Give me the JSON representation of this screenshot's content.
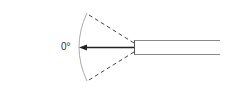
{
  "diagram": {
    "angle_label": "0°",
    "colors": {
      "arc": "#aaaaaa",
      "dashed_lines": "#444444",
      "arrow": "#222222",
      "scope_outline": "#888888",
      "label": "#333333"
    }
  }
}
